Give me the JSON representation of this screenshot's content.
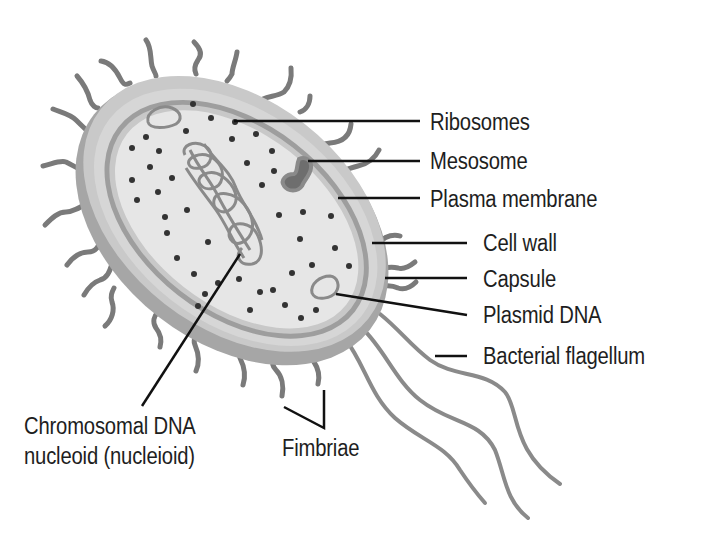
{
  "diagram": {
    "colors": {
      "background": "#ffffff",
      "text": "#1e1e1e",
      "leader_line": "#111111",
      "cytoplasm": "#e4e4e4",
      "membrane": "#9a9a9a",
      "cell_wall": "#c8c8c8",
      "capsule": "#adadad",
      "appendage": "#7a7a7a",
      "mesosome": "#6e6e6e",
      "ribosome_dot": "#333333"
    },
    "labels": {
      "ribosomes": "Ribosomes",
      "mesosome": "Mesosome",
      "plasma_membrane": "Plasma membrane",
      "cell_wall": "Cell wall",
      "capsule": "Capsule",
      "plasmid_dna": "Plasmid DNA",
      "bacterial_flagellum": "Bacterial flagellum",
      "chromosomal_dna_line1": "Chromosomal DNA",
      "chromosomal_dna_line2": "nucleoid (nucleioid)",
      "fimbriae": "Fimbriae"
    }
  }
}
